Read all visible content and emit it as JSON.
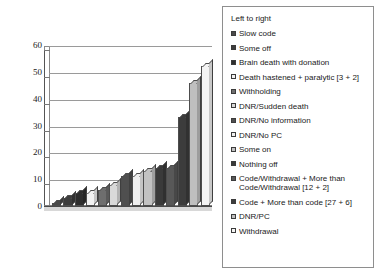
{
  "chart_data": {
    "type": "bar",
    "title": "",
    "xlabel": "",
    "ylabel": "",
    "ylim": [
      0,
      60
    ],
    "yticks": [
      0,
      10,
      20,
      30,
      40,
      50,
      60
    ],
    "grid": true,
    "legend_position": "right",
    "legend_title": "Left to right",
    "categories": [
      "Slow code",
      "Some off",
      "Brain death with donation",
      "Death hastened + paralytic [3 + 2]",
      "Withholding",
      "DNR/Sudden death",
      "DNR/No information",
      "DNR/No PC",
      "Some on",
      "Nothing off",
      "Code/Withdrawal + More than Code/Withdrawal [12 + 2]",
      "Code + More than code [27 + 6]",
      "DNR/PC",
      "Withdrawal"
    ],
    "values": [
      1,
      3,
      5,
      5,
      6,
      8,
      11,
      11,
      13,
      14,
      14,
      33,
      46,
      52
    ],
    "colors": [
      "#4a4a4a",
      "#3d3d3d",
      "#2e2e2e",
      "#f2f2f2",
      "#6e6e6e",
      "#d9d9d9",
      "#4f4f4f",
      "#efefef",
      "#c2c2c2",
      "#3a3a3a",
      "#585858",
      "#3c3c3c",
      "#bfbfbf",
      "#f4f4f4"
    ]
  },
  "legend": {
    "title": "Left to right",
    "items": [
      {
        "label": "Slow code",
        "color": "#4a4a4a"
      },
      {
        "label": "Some off",
        "color": "#3d3d3d"
      },
      {
        "label": "Brain death with donation",
        "color": "#2e2e2e"
      },
      {
        "label": "Death hastened + paralytic [3 + 2]",
        "color": "#f2f2f2"
      },
      {
        "label": "Withholding",
        "color": "#6e6e6e"
      },
      {
        "label": "DNR/Sudden death",
        "color": "#d9d9d9"
      },
      {
        "label": "DNR/No information",
        "color": "#4f4f4f"
      },
      {
        "label": "DNR/No PC",
        "color": "#efefef"
      },
      {
        "label": "Some on",
        "color": "#c2c2c2"
      },
      {
        "label": "Nothing off",
        "color": "#3a3a3a"
      },
      {
        "label": "Code/Withdrawal + More than\nCode/Withdrawal [12 + 2]",
        "color": "#585858"
      },
      {
        "label": "Code + More than code [27 + 6]",
        "color": "#3c3c3c"
      },
      {
        "label": "DNR/PC",
        "color": "#bfbfbf"
      },
      {
        "label": "Withdrawal",
        "color": "#f4f4f4"
      }
    ]
  }
}
